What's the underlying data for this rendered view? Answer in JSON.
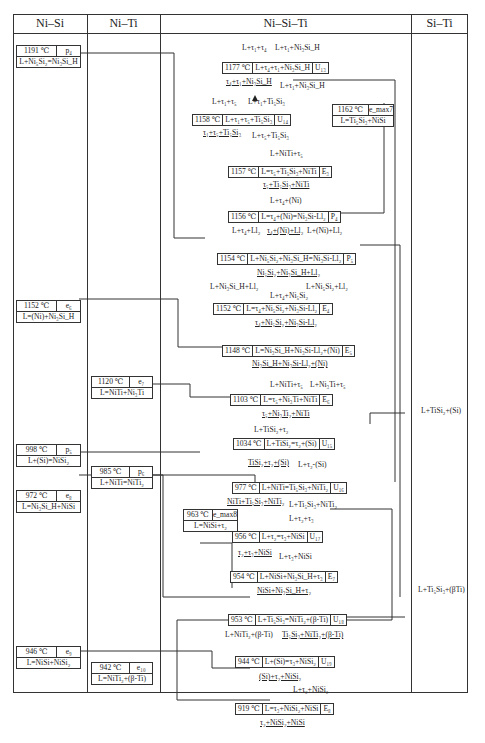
{
  "columns": [
    "Ni–Si",
    "Ni–Ti",
    "Ni–Si–Ti",
    "Si–Ti"
  ],
  "binary_nisi": [
    {
      "temp": "1191 ℃",
      "type": "p₄",
      "reaction": "L+Ni₅Si₂=Ni₃Si_H"
    },
    {
      "temp": "1152 ℃",
      "type": "e₆",
      "reaction": "L=(Ni)+Ni₃Si_H"
    },
    {
      "temp": "998 ℃",
      "type": "p₅",
      "reaction": "L+(Si)=NiSi₂"
    },
    {
      "temp": "972 ℃",
      "type": "e₈",
      "reaction": "L=Ni₃Si_H+NiSi"
    },
    {
      "temp": "946 ℃",
      "type": "e₉",
      "reaction": "L=NiSi+NiSi₂"
    }
  ],
  "binary_niti": [
    {
      "temp": "1120 ℃",
      "type": "e₇",
      "reaction": "L=NiTi+Ni₃Ti"
    },
    {
      "temp": "985 ℃",
      "type": "p₆",
      "reaction": "L+NiTi=NiTi₂"
    },
    {
      "temp": "942 ℃",
      "type": "e₁₀",
      "reaction": "L=NiTi₂+(β-Ti)"
    }
  ],
  "binary_siti": [
    {
      "label": "L+TiSi₂+(Si)"
    },
    {
      "label": "L+Ti₅Si₃+(βTi)"
    }
  ],
  "ternary_boxes": [
    {
      "temp": "1177 ℃",
      "reaction": "L+τ₄+τ₁+Ni₃Si_H",
      "type": "U₁₃"
    },
    {
      "temp": "1158 ℃",
      "reaction": "L+τ₁+τ₅+Ti₅Si₃",
      "type": "U₁₄"
    },
    {
      "temp": "1157 ℃",
      "reaction": "L=τ₅+Ti₅Si₃+NiTi",
      "type": "E₃"
    },
    {
      "temp": "1156 ℃",
      "reaction": "L=τ₄+(Ni)=Ni₃Si-Ll₂",
      "type": "P₄"
    },
    {
      "temp": "1154 ℃",
      "reaction": "L+Ni₅Si₂+Ni₃Si_H=Ni₃Si-Ll₂",
      "type": "P₅"
    },
    {
      "temp": "1152 ℃",
      "reaction": "L=τ₄+Ni₅Si₂+Ni₃Si-Ll₂",
      "type": "E₄"
    },
    {
      "temp": "1148 ℃",
      "reaction": "L=Ni₃Si_H+Ni₃Si-Ll₂+(Ni)",
      "type": "E₅"
    },
    {
      "temp": "1103 ℃",
      "reaction": "L=τ₅+Ni₃Ti+NiTi",
      "type": "E₆"
    },
    {
      "temp": "1034 ℃",
      "reaction": "L+TiSi₂=τ₂+(Si)",
      "type": "U₁₅"
    },
    {
      "temp": "977 ℃",
      "reaction": "L+NiTi=Ti₅Si₃+NiTi₂",
      "type": "U₁₆"
    },
    {
      "temp": "956 ℃",
      "reaction": "L+τ₂=τ₃+NiSi",
      "type": "U₁₇"
    },
    {
      "temp": "954 ℃",
      "reaction": "L+NiSi+Ni₃Si_H+τ₃",
      "type": "E₇"
    },
    {
      "temp": "953 ℃",
      "reaction": "L+Ti₅Si₃=NiTi₂+(β-Ti)",
      "type": "U₁₈"
    },
    {
      "temp": "944 ℃",
      "reaction": "L+(Si)=τ₃+NiSi₂",
      "type": "U₁₉"
    },
    {
      "temp": "919 ℃",
      "reaction": "L=τ₃+NiSi₂+NiSi",
      "type": "E₈"
    }
  ],
  "ternary_max": {
    "temp": "1162 ℃",
    "type": "e_max7",
    "reaction": "L=Ti₅Si₃+NiSi"
  },
  "ternary_max2": {
    "temp": "963 ℃",
    "type": "e_max8",
    "reaction": "L=NiSi+τ₂"
  },
  "labels": {
    "l1": "L+τ₁+τ₄",
    "l2": "L+τ₁+Ni₃Si_H",
    "l3": "τ₄+τ₁+Ni₃Si_H",
    "l4": "L+τ₁+Ni₃Si_H",
    "l5": "L+τ₁+τ₅",
    "l6": "L+τ₁+Ti₅Si₃",
    "l7": "τ₁+τ₅+Ti₅Si₃",
    "l8": "L+τ₅+Ti₅Si₃",
    "l9": "L+NiTi+τ₅",
    "l10": "τ₅+Ti₅Si₃+NiTi",
    "l11": "L+τ₄+(Ni)",
    "l12": "L+τ₄+Ll₂",
    "l13": "τ₄+(Ni)+Ll₂",
    "l14": "L+(Ni)+Ll₂",
    "l15": "Ni₅Si₂+Ni₃Si_H+Ll₂",
    "l16": "L+Ni₃Si_H+Ll₂",
    "l17": "L+Ni₅Si₂+Ll₂",
    "l18": "L+τ₄+Ni₅Si₂",
    "l19": "τ₄+Ni₅Si₂+Ni₃Si-Ll₂",
    "l20": "Ni₃Si_H+Ni₃Si-Ll₂+(Ni)",
    "l21": "L+NiTi+τ₅",
    "l22": "L+Ni₃Ti+τ₅",
    "l23": "τ₅+Ni₃Ti₂+NiTi",
    "l24": "L+TiSi₂+τ₂",
    "l25": "TiSi₂+τ₂+(Si)",
    "l26": "L+τ₂-(Si)",
    "l27": "NiTi+Ti₅Si₃+NiTi₂",
    "l28": "L+Ti₅Si₃+NiTi₂",
    "l29": "L+τ₂+τ₃",
    "l30": "τ₂+τ₃+NiSi",
    "l31": "L+τ₃+NiSi",
    "l32": "NiSi+Ni₃Si_H+τ₂",
    "l33": "L+NiTi₂+(β-Ti)",
    "l34": "Ti₅Si₃+NiTi₂+(β-Ti)",
    "l35": "(Si)+τ₂+NiSi₂",
    "l36": "L+τ₂+NiSi₂",
    "l37": "τ₂+NiSi₂+NiSi"
  }
}
